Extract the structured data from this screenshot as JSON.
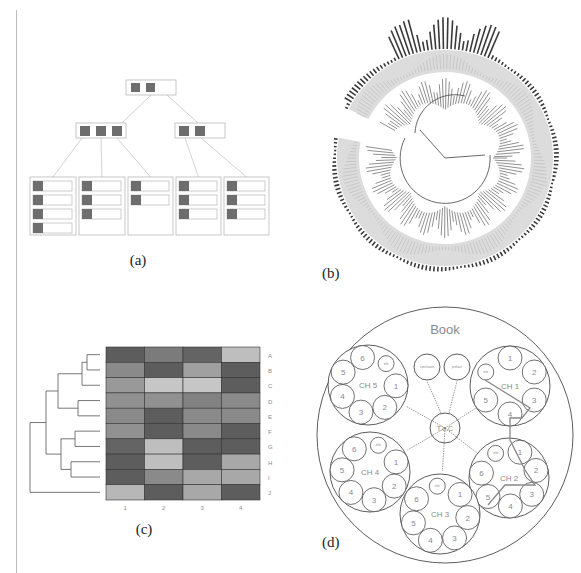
{
  "figure": {
    "panels": [
      {
        "id": "a",
        "caption": "(a)",
        "description": "B-tree with root, two internal nodes and five leaf nodes"
      },
      {
        "id": "b",
        "caption": "(b)",
        "description": "Circular phylogenetic tree with outer bar ring"
      },
      {
        "id": "c",
        "caption": "(c)",
        "description": "Clustered heatmap with row dendrogram"
      },
      {
        "id": "d",
        "caption": "(d)",
        "description": "Nested circle packing of book structure"
      }
    ]
  },
  "panel_a": {
    "caption": "(a)",
    "root_keys": 2,
    "internal_nodes": [
      {
        "keys": 3
      },
      {
        "keys": 2
      }
    ],
    "leaf_nodes": [
      {
        "entries": 4
      },
      {
        "entries": 3
      },
      {
        "entries": 2
      },
      {
        "entries": 3
      },
      {
        "entries": 3
      }
    ],
    "colors": {
      "key": "#6d6d6d",
      "border": "#b8b8b8",
      "edge": "#c8c8c8"
    }
  },
  "panel_b": {
    "caption": "(b)",
    "colors": {
      "ring": "#dcdcdc",
      "bars": "#3a3a3a",
      "branches": "#444444"
    }
  },
  "panel_c": {
    "caption": "(c)",
    "row_labels": [
      "A",
      "B",
      "C",
      "D",
      "E",
      "F",
      "G",
      "H",
      "I",
      "J"
    ],
    "col_labels": [
      "1",
      "2",
      "3",
      "4"
    ]
  },
  "panel_d": {
    "caption": "(d)",
    "title": "Book",
    "center": "T.o.C",
    "top_nodes": [
      "conclusion",
      "preface"
    ],
    "chapters": [
      {
        "label": "CH 1",
        "sections": [
          "1",
          "2",
          "3",
          "4",
          "5",
          "info"
        ]
      },
      {
        "label": "CH 2",
        "sections": [
          "1",
          "2",
          "3",
          "4",
          "5",
          "6",
          "info"
        ]
      },
      {
        "label": "CH 3",
        "sections": [
          "1",
          "2",
          "3",
          "4",
          "5",
          "6",
          "info"
        ]
      },
      {
        "label": "CH 4",
        "sections": [
          "1",
          "2",
          "3",
          "4",
          "5",
          "6",
          "info"
        ]
      },
      {
        "label": "CH 5",
        "sections": [
          "1",
          "2",
          "3",
          "4",
          "5",
          "6",
          "info"
        ]
      }
    ]
  },
  "chart_data": {
    "type": "heatmap",
    "title": "",
    "xlabel": "",
    "ylabel": "",
    "rows": [
      "A",
      "B",
      "C",
      "D",
      "E",
      "F",
      "G",
      "H",
      "I",
      "J"
    ],
    "cols": [
      "1",
      "2",
      "3",
      "4"
    ],
    "values": [
      [
        0.85,
        0.65,
        0.8,
        0.2
      ],
      [
        0.55,
        0.85,
        0.4,
        0.85
      ],
      [
        0.45,
        0.15,
        0.15,
        0.85
      ],
      [
        0.5,
        0.5,
        0.6,
        0.55
      ],
      [
        0.55,
        0.85,
        0.55,
        0.55
      ],
      [
        0.5,
        0.85,
        0.55,
        0.85
      ],
      [
        0.8,
        0.2,
        0.85,
        0.85
      ],
      [
        0.85,
        0.2,
        0.85,
        0.35
      ],
      [
        0.85,
        0.55,
        0.35,
        0.35
      ],
      [
        0.25,
        0.85,
        0.35,
        0.85
      ]
    ],
    "value_scale": "grayscale intensity 0=light, 1=dark",
    "dendrogram": "rows clustered; left-side tree"
  }
}
